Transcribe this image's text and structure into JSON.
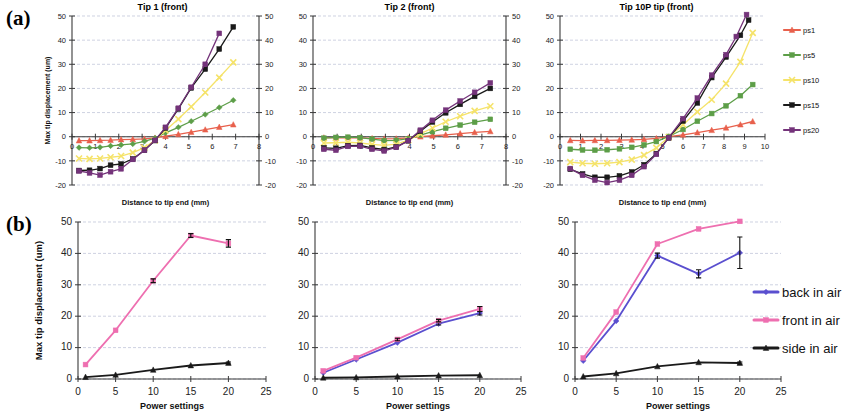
{
  "figure": {
    "width": 851,
    "height": 411,
    "row_labels": {
      "a": "(a)",
      "b": "(b)"
    }
  },
  "colors": {
    "ps1": "#e8604c",
    "ps5": "#5d9e48",
    "ps10": "#f5e36a",
    "ps15": "#1a1a1a",
    "ps20": "#74337a",
    "back_in_air": "#5a4fcf",
    "front_in_air": "#ee6fb0",
    "side_in_air": "#1a1a1a",
    "grid": "#b9bfd4",
    "axis": "#3a3a3a"
  },
  "legend_a": {
    "items": [
      {
        "label": "ps1",
        "color_key": "ps1"
      },
      {
        "label": "ps5",
        "color_key": "ps5"
      },
      {
        "label": "ps10",
        "color_key": "ps10"
      },
      {
        "label": "ps15",
        "color_key": "ps15"
      },
      {
        "label": "ps20",
        "color_key": "ps20"
      }
    ]
  },
  "legend_b": {
    "items": [
      {
        "label": "back in air",
        "color_key": "back_in_air"
      },
      {
        "label": "front in air",
        "color_key": "front_in_air"
      },
      {
        "label": "side in air",
        "color_key": "side_in_air"
      }
    ]
  },
  "chart_data": [
    {
      "id": "a1",
      "type": "line",
      "title": "Tip 1 (front)",
      "xlabel": "Distance to tip end (mm)",
      "ylabel": "Max tip displacement (um)",
      "xlim": [
        0,
        8
      ],
      "ylim": [
        -20,
        50
      ],
      "xticks": [
        0,
        1,
        2,
        3,
        4,
        5,
        6,
        7,
        8
      ],
      "yticks": [
        -20,
        -10,
        0,
        10,
        20,
        30,
        40,
        50
      ],
      "grid": true,
      "legend_position": "right-of-figure",
      "series": [
        {
          "name": "ps1",
          "color_key": "ps1",
          "marker": "triangle",
          "x": [
            0.3,
            0.75,
            1.2,
            1.65,
            2.1,
            2.6,
            3.1,
            3.55,
            4.0,
            4.55,
            5.1,
            5.7,
            6.3,
            6.9
          ],
          "y": [
            -1.6,
            -1.6,
            -1.5,
            -1.4,
            -1.2,
            -1.1,
            -0.9,
            -0.5,
            0.2,
            1.0,
            1.9,
            2.9,
            4.0,
            5.0
          ]
        },
        {
          "name": "ps5",
          "color_key": "ps5",
          "marker": "diamond",
          "x": [
            0.3,
            0.75,
            1.2,
            1.65,
            2.1,
            2.6,
            3.1,
            3.55,
            4.0,
            4.55,
            5.1,
            5.7,
            6.3,
            6.9
          ],
          "y": [
            -4.5,
            -4.6,
            -4.4,
            -3.8,
            -3.4,
            -3.0,
            -1.9,
            -0.6,
            1.6,
            3.9,
            6.4,
            9.2,
            12.1,
            15.1
          ]
        },
        {
          "name": "ps10",
          "color_key": "ps10",
          "marker": "cross",
          "x": [
            0.3,
            0.75,
            1.2,
            1.65,
            2.1,
            2.6,
            3.1,
            3.55,
            4.0,
            4.55,
            5.1,
            5.7,
            6.3,
            6.9
          ],
          "y": [
            -9.0,
            -9.2,
            -9.0,
            -8.5,
            -8.0,
            -6.6,
            -4.5,
            -1.5,
            2.6,
            7.3,
            12.4,
            18.3,
            24.5,
            30.8
          ]
        },
        {
          "name": "ps15",
          "color_key": "ps15",
          "marker": "square",
          "x": [
            0.3,
            0.75,
            1.2,
            1.65,
            2.1,
            2.6,
            3.1,
            3.55,
            4.0,
            4.55,
            5.1,
            5.7,
            6.3,
            6.9
          ],
          "y": [
            -14.0,
            -13.9,
            -13.2,
            -11.8,
            -11.3,
            -9.2,
            -5.6,
            -1.6,
            3.6,
            11.5,
            20.2,
            28.0,
            36.3,
            45.5
          ]
        },
        {
          "name": "ps20",
          "color_key": "ps20",
          "marker": "square",
          "x": [
            0.3,
            0.75,
            1.2,
            1.65,
            2.1,
            2.6,
            3.1,
            3.55,
            4.0,
            4.55,
            5.1,
            5.7,
            6.3
          ],
          "y": [
            -14.2,
            -15.0,
            -15.9,
            -14.5,
            -13.3,
            -9.4,
            -5.6,
            -1.5,
            3.9,
            11.8,
            20.5,
            30.0,
            42.8
          ]
        }
      ]
    },
    {
      "id": "a2",
      "type": "line",
      "title": "Tip 2 (front)",
      "xlabel": "Distance to tip end (mm)",
      "ylabel": "",
      "xlim": [
        0,
        8
      ],
      "ylim": [
        -20,
        50
      ],
      "xticks": [
        0,
        1,
        2,
        3,
        4,
        5,
        6,
        7,
        8
      ],
      "yticks": [
        -20,
        -10,
        0,
        10,
        20,
        30,
        40,
        50
      ],
      "grid": true,
      "legend_position": "none",
      "series": [
        {
          "name": "ps1",
          "color_key": "ps1",
          "marker": "triangle",
          "x": [
            0.45,
            0.95,
            1.45,
            1.95,
            2.45,
            2.95,
            3.45,
            3.95,
            4.45,
            4.95,
            5.5,
            6.1,
            6.7,
            7.35
          ],
          "y": [
            -0.4,
            -0.5,
            -0.4,
            -0.5,
            -0.7,
            -0.9,
            -0.8,
            -0.5,
            0.0,
            0.4,
            0.8,
            1.3,
            1.8,
            2.2
          ]
        },
        {
          "name": "ps5",
          "color_key": "ps5",
          "marker": "square",
          "x": [
            0.45,
            0.95,
            1.45,
            1.95,
            2.45,
            2.95,
            3.45,
            3.95,
            4.45,
            4.95,
            5.5,
            6.1,
            6.7,
            7.35
          ],
          "y": [
            -0.6,
            -0.3,
            -0.2,
            -0.4,
            -1.0,
            -1.6,
            -1.5,
            -0.8,
            0.7,
            2.1,
            3.5,
            4.8,
            6.0,
            7.2
          ]
        },
        {
          "name": "ps10",
          "color_key": "ps10",
          "marker": "cross",
          "x": [
            0.45,
            0.95,
            1.45,
            1.95,
            2.45,
            2.95,
            3.45,
            3.95,
            4.45,
            4.95,
            5.5,
            6.1,
            6.7,
            7.35
          ],
          "y": [
            -2.6,
            -2.5,
            -2.3,
            -2.6,
            -3.2,
            -3.6,
            -3.1,
            -1.4,
            1.2,
            3.6,
            6.2,
            8.5,
            10.7,
            12.6
          ]
        },
        {
          "name": "ps15",
          "color_key": "ps15",
          "marker": "square",
          "x": [
            0.45,
            0.95,
            1.45,
            1.95,
            2.45,
            2.95,
            3.45,
            3.95,
            4.45,
            4.95,
            5.5,
            6.1,
            6.7,
            7.35
          ],
          "y": [
            -4.6,
            -4.8,
            -3.7,
            -3.6,
            -4.6,
            -5.3,
            -4.2,
            -1.7,
            2.3,
            6.1,
            9.9,
            13.4,
            16.7,
            20.0
          ]
        },
        {
          "name": "ps20",
          "color_key": "ps20",
          "marker": "square",
          "x": [
            0.45,
            0.95,
            1.45,
            1.95,
            2.45,
            2.95,
            3.45,
            3.95,
            4.45,
            4.95,
            5.5,
            6.1,
            6.7,
            7.35
          ],
          "y": [
            -5.2,
            -5.6,
            -4.0,
            -3.9,
            -5.2,
            -5.9,
            -4.4,
            -1.6,
            2.7,
            6.8,
            11.0,
            14.8,
            18.4,
            22.3
          ]
        }
      ]
    },
    {
      "id": "a3",
      "type": "line",
      "title": "Tip 10P tip (front)",
      "xlabel": "Distance to tip end (mm)",
      "ylabel": "",
      "xlim": [
        0,
        10
      ],
      "ylim": [
        -20,
        50
      ],
      "xticks": [
        0,
        1,
        2,
        3,
        4,
        5,
        6,
        7,
        8,
        9,
        10
      ],
      "yticks": [
        -20,
        -10,
        0,
        10,
        20,
        30,
        40,
        50
      ],
      "grid": true,
      "legend_position": "right",
      "series": [
        {
          "name": "ps1",
          "color_key": "ps1",
          "marker": "triangle",
          "x": [
            0.5,
            1.1,
            1.7,
            2.3,
            2.9,
            3.5,
            4.1,
            4.7,
            5.3,
            6.0,
            6.7,
            7.4,
            8.1,
            8.8,
            9.4
          ],
          "y": [
            -1.5,
            -1.6,
            -1.5,
            -1.5,
            -1.4,
            -1.3,
            -1.1,
            -0.7,
            0.0,
            0.8,
            1.7,
            2.7,
            3.7,
            5.0,
            6.3
          ]
        },
        {
          "name": "ps5",
          "color_key": "ps5",
          "marker": "square",
          "x": [
            0.5,
            1.1,
            1.7,
            2.3,
            2.9,
            3.5,
            4.1,
            4.7,
            5.3,
            6.0,
            6.7,
            7.4,
            8.1,
            8.8,
            9.4
          ],
          "y": [
            -5.2,
            -5.5,
            -5.6,
            -5.4,
            -5.0,
            -4.4,
            -3.4,
            -2.0,
            0.1,
            3.0,
            6.4,
            9.6,
            12.8,
            17.0,
            21.6
          ]
        },
        {
          "name": "ps10",
          "color_key": "ps10",
          "marker": "cross",
          "x": [
            0.5,
            1.1,
            1.7,
            2.3,
            2.9,
            3.5,
            4.1,
            4.7,
            5.3,
            6.0,
            6.7,
            7.4,
            8.1,
            8.8,
            9.4
          ],
          "y": [
            -10.5,
            -11.0,
            -11.2,
            -11.0,
            -10.5,
            -9.5,
            -7.6,
            -4.6,
            -0.2,
            5.0,
            10.3,
            15.3,
            22.0,
            31.0,
            43.0
          ]
        },
        {
          "name": "ps15",
          "color_key": "ps15",
          "marker": "square",
          "x": [
            0.5,
            1.1,
            1.7,
            2.3,
            2.9,
            3.5,
            4.1,
            4.7,
            5.3,
            6.0,
            6.7,
            7.4,
            8.1,
            8.8,
            9.2
          ],
          "y": [
            -13.5,
            -15.4,
            -16.8,
            -16.8,
            -16.2,
            -14.6,
            -11.6,
            -7.0,
            -0.5,
            6.5,
            14.0,
            24.5,
            33.0,
            42.0,
            48.3
          ]
        },
        {
          "name": "ps20",
          "color_key": "ps20",
          "marker": "square",
          "x": [
            0.5,
            1.1,
            1.7,
            2.3,
            2.9,
            3.5,
            4.1,
            4.7,
            5.3,
            6.0,
            6.7,
            7.4,
            8.1,
            8.6,
            9.1
          ],
          "y": [
            -13.2,
            -16.0,
            -18.0,
            -19.0,
            -18.0,
            -16.0,
            -12.4,
            -7.3,
            -0.4,
            7.5,
            16.0,
            25.5,
            34.0,
            41.5,
            50.6
          ]
        }
      ]
    },
    {
      "id": "b1",
      "type": "line",
      "title": "",
      "xlabel": "Power settings",
      "ylabel": "Max tip displacement (um)",
      "xlim": [
        0,
        25
      ],
      "ylim": [
        0,
        50
      ],
      "xticks": [
        0,
        5,
        10,
        15,
        20,
        25
      ],
      "yticks": [
        0,
        10,
        20,
        30,
        40,
        50
      ],
      "grid": true,
      "legend_position": "none",
      "series": [
        {
          "name": "front in air",
          "color_key": "front_in_air",
          "marker": "square",
          "x": [
            1,
            5,
            10,
            15,
            20
          ],
          "y": [
            4.6,
            15.5,
            31.3,
            45.7,
            43.2
          ],
          "err": [
            0,
            0,
            0.6,
            0.6,
            1.2
          ]
        },
        {
          "name": "side in air",
          "color_key": "side_in_air",
          "marker": "triangle",
          "x": [
            1,
            5,
            10,
            15,
            20
          ],
          "y": [
            0.6,
            1.3,
            2.9,
            4.3,
            5.1
          ],
          "err": [
            0,
            0,
            0,
            0,
            0.3
          ]
        }
      ]
    },
    {
      "id": "b2",
      "type": "line",
      "title": "",
      "xlabel": "Power settings",
      "ylabel": "",
      "xlim": [
        0,
        25
      ],
      "ylim": [
        0,
        50
      ],
      "xticks": [
        0,
        5,
        10,
        15,
        20,
        25
      ],
      "yticks": [
        0,
        10,
        20,
        30,
        40,
        50
      ],
      "grid": true,
      "legend_position": "none",
      "series": [
        {
          "name": "back in air",
          "color_key": "back_in_air",
          "marker": "diamond",
          "x": [
            1,
            5,
            10,
            15,
            20
          ],
          "y": [
            2.0,
            6.2,
            11.6,
            17.6,
            21.0
          ],
          "err": [
            0,
            0,
            0,
            0.4,
            0.6
          ]
        },
        {
          "name": "front in air",
          "color_key": "front_in_air",
          "marker": "square",
          "x": [
            1,
            5,
            10,
            15,
            20
          ],
          "y": [
            2.6,
            6.8,
            12.6,
            18.6,
            22.3
          ],
          "err": [
            0,
            0,
            0.4,
            0.4,
            0.8
          ]
        },
        {
          "name": "side in air",
          "color_key": "side_in_air",
          "marker": "triangle",
          "x": [
            1,
            5,
            10,
            15,
            20
          ],
          "y": [
            0.4,
            0.5,
            0.8,
            1.1,
            1.2
          ],
          "err": [
            0,
            0,
            0,
            0,
            0
          ]
        }
      ]
    },
    {
      "id": "b3",
      "type": "line",
      "title": "",
      "xlabel": "Power settings",
      "ylabel": "",
      "xlim": [
        0,
        25
      ],
      "ylim": [
        0,
        50
      ],
      "xticks": [
        0,
        5,
        10,
        15,
        20,
        25
      ],
      "yticks": [
        0,
        10,
        20,
        30,
        40,
        50
      ],
      "grid": true,
      "legend_position": "right",
      "series": [
        {
          "name": "back in air",
          "color_key": "back_in_air",
          "marker": "diamond",
          "x": [
            1,
            5,
            10,
            15,
            20
          ],
          "y": [
            5.8,
            18.5,
            39.3,
            33.5,
            40.2
          ],
          "err": [
            0,
            0,
            0.8,
            1.3,
            5.0
          ]
        },
        {
          "name": "front in air",
          "color_key": "front_in_air",
          "marker": "square",
          "x": [
            1,
            5,
            10,
            15,
            20
          ],
          "y": [
            6.7,
            21.3,
            43.0,
            47.8,
            50.2
          ],
          "err": [
            0,
            0,
            0,
            0,
            0
          ]
        },
        {
          "name": "side in air",
          "color_key": "side_in_air",
          "marker": "triangle",
          "x": [
            1,
            5,
            10,
            15,
            20
          ],
          "y": [
            0.8,
            1.8,
            4.0,
            5.3,
            5.1
          ],
          "err": [
            0,
            0,
            0,
            0,
            0.3
          ]
        }
      ]
    },
    {
      "id": "b3-extra",
      "type": "annotation",
      "note": "black error bar marker at power 20 centered near 44 spanning 35 to 48"
    }
  ]
}
